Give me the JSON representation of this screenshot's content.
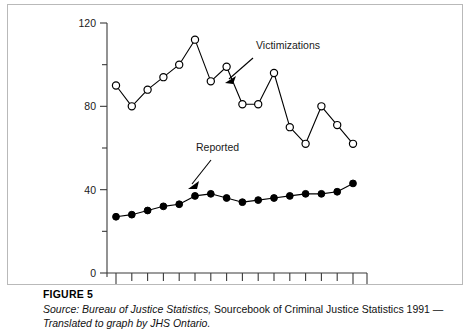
{
  "figure": {
    "number_label": "FIGURE 5",
    "source_prefix": "Source: Bureau of Justice Statistics,",
    "source_middle": " Sourcebook of Criminal Justice Statistics 1991 —",
    "source_line2": "Translated to graph by JHS Ontario."
  },
  "annotations": {
    "victimizations_label": "Victimizations",
    "reported_label": "Reported"
  },
  "chart_data": {
    "type": "line",
    "title": "",
    "subtitle": "",
    "xlabel": "",
    "ylabel": "",
    "xlim": [
      1975,
      1990
    ],
    "ylim": [
      0,
      120
    ],
    "grid": false,
    "legend_position": "inline-annotation",
    "x_tick_labels": [
      "1975",
      "1990"
    ],
    "x_tick_label_values": [
      1975,
      1990
    ],
    "x_minor_ticks_every": 1,
    "y_tick_labels": [
      "0",
      "40",
      "80",
      "120"
    ],
    "y_tick_label_values": [
      0,
      40,
      80,
      120
    ],
    "y_minor_ticks_every": 20,
    "x": [
      1975,
      1976,
      1977,
      1978,
      1979,
      1980,
      1981,
      1982,
      1983,
      1984,
      1985,
      1986,
      1987,
      1988,
      1989,
      1990
    ],
    "series": [
      {
        "name": "Victimizations",
        "marker": "open-circle",
        "values": [
          90,
          80,
          88,
          94,
          100,
          112,
          92,
          99,
          81,
          81,
          96,
          70,
          62,
          80,
          71,
          62
        ]
      },
      {
        "name": "Reported",
        "marker": "filled-circle",
        "values": [
          27,
          28,
          30,
          32,
          33,
          37,
          38,
          36,
          34,
          35,
          36,
          37,
          38,
          38,
          39,
          43
        ]
      }
    ]
  }
}
